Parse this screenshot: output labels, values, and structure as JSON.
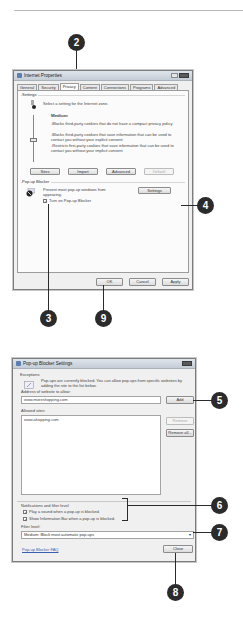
{
  "callouts": [
    "2",
    "4",
    "3",
    "9",
    "5",
    "6",
    "7",
    "8"
  ],
  "internet_properties": {
    "title": "Internet Properties",
    "tabs": [
      "General",
      "Security",
      "Privacy",
      "Content",
      "Connections",
      "Programs",
      "Advanced"
    ],
    "active_tab": "Privacy",
    "settings": {
      "group_label": "Settings",
      "intro": "Select a setting for the Internet zone.",
      "level": "Medium",
      "bullets": [
        "-Blocks third-party cookies that do not have a compact privacy policy",
        "-Blocks third-party cookies that save information that can be used to contact you without your explicit consent",
        "-Restricts first-party cookies that save information that can be used to contact you without your implicit consent"
      ],
      "buttons": {
        "sites": "Sites",
        "import": "Import",
        "advanced": "Advanced",
        "default": "Default"
      }
    },
    "popup_blocker": {
      "group_label": "Pop-up Blocker",
      "description": "Prevent most pop-up windows from appearing.",
      "settings_button": "Settings",
      "turn_on_label": "Turn on Pop-up Blocker",
      "turn_on_checked": "✓"
    },
    "footer_buttons": {
      "ok": "OK",
      "cancel": "Cancel",
      "apply": "Apply"
    }
  },
  "popup_settings": {
    "title": "Pop-up Blocker Settings",
    "exceptions": {
      "group_label": "Exceptions",
      "description": "Pop-ups are currently blocked. You can allow pop-ups from specific websites by adding the site to the list below.",
      "address_label": "Address of website to allow:",
      "address_value": "www.moreshopping.com",
      "add_button": "Add",
      "allowed_label": "Allowed sites:",
      "allowed_sites": [
        "www.ahopping.com"
      ],
      "remove_button": "Remove",
      "remove_all_button": "Remove all..."
    },
    "notifications": {
      "group_label": "Notifications and filter level",
      "play_sound_label": "Play a sound when a pop-up is blocked.",
      "play_sound_checked": "✓",
      "show_infobar_label": "Show Information Bar when a pop-up is blocked.",
      "show_infobar_checked": "✓",
      "filter_label": "Filter level:",
      "filter_value": "Medium: Block most automatic pop-ups",
      "filter_arrow": "▾"
    },
    "faq_link": "Pop-up Blocker FAQ",
    "close_button": "Close"
  }
}
